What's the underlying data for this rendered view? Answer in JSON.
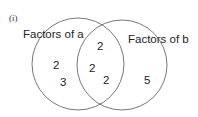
{
  "part_label": "(i)",
  "sets": {
    "a": {
      "label": "Factors of a",
      "only": [
        "2",
        "3"
      ]
    },
    "b": {
      "label": "Factors of b",
      "only": [
        "5"
      ]
    },
    "intersection": [
      "2",
      "2",
      "2"
    ]
  },
  "colors": {
    "circle": "#555555",
    "text": "#222222"
  }
}
